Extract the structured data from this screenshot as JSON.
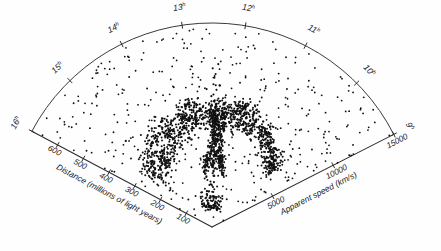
{
  "chart_data": {
    "type": "scatter",
    "title": "",
    "projection": "polar-wedge",
    "grid": false,
    "legend_position": "none",
    "background_color": "#fefefe",
    "point_color": "#111111",
    "axis_color": "#2b2b2b",
    "apex": {
      "x": 212,
      "y": 227
    },
    "radius_px": 204,
    "angle_start_deg": -152.0,
    "angle_end_deg": -27.0,
    "left_axis": {
      "label": "Distance (millions of light years)",
      "ticks": [
        100,
        200,
        300,
        400,
        500,
        600
      ],
      "tick_labels": [
        "100",
        "200",
        "300",
        "400",
        "500",
        "600"
      ],
      "max": 700,
      "unit": "millions of light years"
    },
    "right_axis": {
      "label": "Apparent speed (km/s)",
      "ticks": [
        5000,
        10000,
        15000
      ],
      "tick_labels": [
        "5000",
        "10000",
        "15000"
      ],
      "max": 15000,
      "unit": "km/s"
    },
    "arc_axis": {
      "label": "Right ascension",
      "tick_labels": [
        "16",
        "15",
        "14",
        "13",
        "12",
        "11",
        "10",
        "9"
      ],
      "tick_superscript": "h",
      "unit": "hours"
    },
    "points": [
      [
        -148.7,
        0.72
      ],
      [
        -150.5,
        0.55
      ],
      [
        -147.0,
        0.41
      ],
      [
        -145.2,
        0.88
      ],
      [
        -143.6,
        0.63
      ],
      [
        -142.1,
        0.34
      ],
      [
        -141.0,
        0.77
      ],
      [
        -139.8,
        0.52
      ],
      [
        -138.2,
        0.91
      ],
      [
        -137.0,
        0.44
      ],
      [
        -136.1,
        0.67
      ],
      [
        -134.8,
        0.3
      ],
      [
        -133.5,
        0.82
      ],
      [
        -132.4,
        0.59
      ],
      [
        -131.0,
        0.73
      ],
      [
        -129.8,
        0.46
      ],
      [
        -128.6,
        0.86
      ],
      [
        -127.3,
        0.38
      ],
      [
        -126.0,
        0.64
      ],
      [
        -124.9,
        0.55
      ],
      [
        -123.8,
        0.79
      ],
      [
        -122.5,
        0.33
      ],
      [
        -121.2,
        0.7
      ],
      [
        -120.0,
        0.49
      ],
      [
        -118.9,
        0.84
      ],
      [
        -117.6,
        0.61
      ],
      [
        -116.4,
        0.36
      ],
      [
        -115.1,
        0.75
      ],
      [
        -114.0,
        0.53
      ],
      [
        -112.8,
        0.89
      ],
      [
        -111.5,
        0.42
      ],
      [
        -110.3,
        0.66
      ],
      [
        -109.0,
        0.31
      ],
      [
        -107.8,
        0.8
      ],
      [
        -106.5,
        0.57
      ],
      [
        -105.3,
        0.71
      ],
      [
        -104.0,
        0.45
      ],
      [
        -102.8,
        0.85
      ],
      [
        -101.5,
        0.39
      ],
      [
        -100.2,
        0.62
      ],
      [
        -99.0,
        0.54
      ],
      [
        -97.8,
        0.78
      ],
      [
        -96.5,
        0.35
      ],
      [
        -95.2,
        0.69
      ],
      [
        -94.0,
        0.48
      ],
      [
        -92.8,
        0.83
      ],
      [
        -91.5,
        0.6
      ],
      [
        -90.2,
        0.37
      ],
      [
        -89.0,
        0.74
      ],
      [
        -87.8,
        0.51
      ],
      [
        -86.5,
        0.87
      ],
      [
        -85.2,
        0.43
      ],
      [
        -84.0,
        0.65
      ],
      [
        -82.8,
        0.32
      ],
      [
        -81.5,
        0.81
      ],
      [
        -80.2,
        0.58
      ],
      [
        -79.0,
        0.72
      ],
      [
        -77.8,
        0.47
      ],
      [
        -76.5,
        0.9
      ],
      [
        -75.2,
        0.4
      ],
      [
        -74.0,
        0.63
      ],
      [
        -72.8,
        0.56
      ],
      [
        -71.5,
        0.76
      ],
      [
        -70.2,
        0.34
      ],
      [
        -69.0,
        0.68
      ],
      [
        -67.8,
        0.5
      ],
      [
        -66.5,
        0.82
      ],
      [
        -65.2,
        0.38
      ],
      [
        -64.0,
        0.61
      ],
      [
        -62.8,
        0.53
      ],
      [
        -61.5,
        0.77
      ],
      [
        -60.2,
        0.36
      ],
      [
        -59.0,
        0.7
      ],
      [
        -57.8,
        0.45
      ],
      [
        -56.5,
        0.86
      ],
      [
        -55.2,
        0.59
      ],
      [
        -54.0,
        0.33
      ],
      [
        -52.8,
        0.73
      ],
      [
        -51.5,
        0.49
      ],
      [
        -50.2,
        0.84
      ],
      [
        -49.0,
        0.42
      ],
      [
        -47.8,
        0.64
      ],
      [
        -46.5,
        0.3
      ],
      [
        -45.2,
        0.79
      ],
      [
        -44.0,
        0.55
      ],
      [
        -42.8,
        0.71
      ],
      [
        -41.5,
        0.46
      ],
      [
        -40.2,
        0.88
      ],
      [
        -39.0,
        0.37
      ],
      [
        -37.8,
        0.62
      ],
      [
        -36.5,
        0.52
      ],
      [
        -35.2,
        0.75
      ],
      [
        -34.0,
        0.31
      ],
      [
        -32.8,
        0.67
      ],
      [
        -31.5,
        0.44
      ],
      [
        -30.2,
        0.8
      ],
      [
        -29.0,
        0.57
      ]
    ],
    "n_points_approx": 1100,
    "structures": [
      {
        "name": "stickman-coma-cluster",
        "ra_center_deg": -88.0,
        "r_center": 0.47
      },
      {
        "name": "great-wall-left-filament",
        "ra_start_deg": -140.0,
        "ra_end_deg": -96.0
      },
      {
        "name": "great-wall-right-filament",
        "ra_start_deg": -80.0,
        "ra_end_deg": -42.0
      }
    ]
  }
}
